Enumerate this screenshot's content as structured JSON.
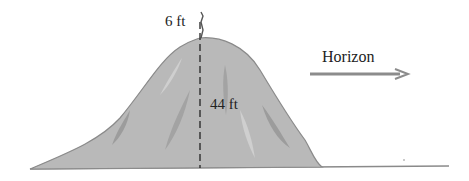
{
  "diagram": {
    "person_height_label": "6 ft",
    "hill_height_label": "44 ft",
    "horizon_label": "Horizon",
    "colors": {
      "hill_fill": "#b9b9b9",
      "hill_outline": "#8a8a8a",
      "streak_dark": "#9c9c9c",
      "streak_light": "#cfcfcf",
      "ground": "#8a8a8a",
      "arrow": "#8c8c8c",
      "dashed_line": "#222222"
    }
  }
}
